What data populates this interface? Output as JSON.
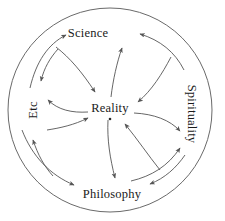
{
  "diagram": {
    "stroke_color": "#555555",
    "text_color": "#1a1a1a",
    "background_color": "#ffffff",
    "outer_circle": {
      "name": "outer-boundary-circle",
      "center_x": 110,
      "center_y": 110,
      "radius": 102
    },
    "center_node": {
      "id": "reality",
      "label": "Reality",
      "x": 110,
      "y": 108,
      "has_center_dot": true
    },
    "nodes": [
      {
        "id": "science",
        "label": "Science",
        "x": 88,
        "y": 33,
        "rotation": 0,
        "position": "top"
      },
      {
        "id": "spirituality",
        "label": "Spirituality",
        "x": 192,
        "y": 114,
        "rotation": 90,
        "position": "right"
      },
      {
        "id": "philosophy",
        "label": "Philosophy",
        "x": 112,
        "y": 194,
        "rotation": 0,
        "position": "bottom"
      },
      {
        "id": "etc",
        "label": "Etc",
        "x": 33,
        "y": 110,
        "rotation": -90,
        "position": "left"
      }
    ],
    "edges": [
      {
        "id": "reality-to-science",
        "from": "reality",
        "to": "science"
      },
      {
        "id": "reality-to-philosophy",
        "from": "reality",
        "to": "philosophy"
      },
      {
        "id": "reality-to-spirituality",
        "from": "reality",
        "to": "spirituality"
      },
      {
        "id": "reality-to-etc",
        "from": "reality",
        "to": "etc"
      },
      {
        "id": "science-to-reality",
        "from": "science",
        "to": "reality"
      },
      {
        "id": "spirituality-to-reality",
        "from": "spirituality",
        "to": "reality"
      },
      {
        "id": "philosophy-to-reality",
        "from": "philosophy",
        "to": "reality"
      },
      {
        "id": "etc-to-reality",
        "from": "etc",
        "to": "reality"
      },
      {
        "id": "etc-to-science",
        "from": "etc",
        "to": "science"
      },
      {
        "id": "science-to-etc",
        "from": "science",
        "to": "etc"
      },
      {
        "id": "spirituality-to-science",
        "from": "spirituality",
        "to": "science"
      },
      {
        "id": "philosophy-to-spirituality",
        "from": "philosophy",
        "to": "spirituality"
      },
      {
        "id": "spirituality-to-philosophy",
        "from": "spirituality",
        "to": "philosophy"
      },
      {
        "id": "etc-to-philosophy",
        "from": "etc",
        "to": "philosophy"
      },
      {
        "id": "philosophy-to-etc",
        "from": "philosophy",
        "to": "etc"
      }
    ]
  }
}
